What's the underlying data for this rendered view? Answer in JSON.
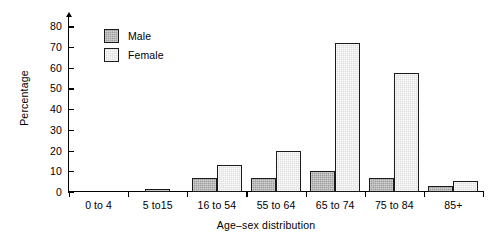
{
  "chart_data": {
    "type": "bar",
    "title": "",
    "xlabel": "Age–sex distribution",
    "ylabel": "Percentage",
    "categories": [
      "0 to 4",
      "5 to15",
      "16 to 54",
      "55 to 64",
      "65 to 74",
      "75 to 84",
      "85+"
    ],
    "series": [
      {
        "name": "Male",
        "color": "#9e9e9e",
        "values": [
          0,
          1.5,
          7,
          7,
          10,
          7,
          3
        ]
      },
      {
        "name": "Female",
        "color": "#dedede",
        "values": [
          0,
          0,
          13,
          20,
          72,
          57.5,
          5.5
        ]
      }
    ],
    "ylim": [
      0,
      85
    ],
    "yticks": [
      0,
      10,
      20,
      30,
      40,
      50,
      60,
      70,
      80
    ],
    "ytick_labels": [
      "0",
      "10",
      "20",
      "30",
      "40",
      "50",
      "60",
      "70",
      "80"
    ],
    "grid": false,
    "legend_position": "upper-left"
  },
  "legend": {
    "items": [
      {
        "label": "Male"
      },
      {
        "label": "Female"
      }
    ]
  }
}
